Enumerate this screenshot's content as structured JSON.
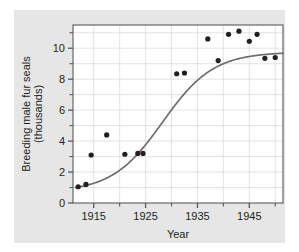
{
  "figure": {
    "partial_caption_top": "",
    "background_color": "#e6e6e6",
    "plot_background_color": "#ffffff",
    "grid_color": "#d7d7d7",
    "axis_color": "#58595b",
    "point_color": "#231f20",
    "curve_color": "#6d6e71"
  },
  "chart_data": {
    "type": "scatter",
    "title": "",
    "xlabel": "Year",
    "ylabel": "Breeding male fur seals (thousands)",
    "ylabel_line1": "Breeding male fur seals",
    "ylabel_line2": "(thousands)",
    "xlim": [
      1911,
      1951.5
    ],
    "ylim": [
      0,
      11.5
    ],
    "xticks": [
      1915,
      1925,
      1935,
      1945
    ],
    "xtick_labels": [
      "1915",
      "1925",
      "1935",
      "1945"
    ],
    "x_minor_ticks": [
      1920,
      1930,
      1940,
      1950
    ],
    "yticks": [
      0,
      2,
      4,
      6,
      8,
      10
    ],
    "ytick_labels": [
      "0",
      "2",
      "4",
      "6",
      "8",
      "10"
    ],
    "y_minor_ticks": [
      1,
      3,
      5,
      7,
      9,
      11
    ],
    "grid": true,
    "legend": "none",
    "series": [
      {
        "name": "Breeding male fur seals",
        "type": "scatter",
        "marker": "filled-circle",
        "points": [
          {
            "x": 1912.0,
            "y": 1.05
          },
          {
            "x": 1913.5,
            "y": 1.2
          },
          {
            "x": 1914.5,
            "y": 3.1
          },
          {
            "x": 1917.5,
            "y": 4.4
          },
          {
            "x": 1921.0,
            "y": 3.15
          },
          {
            "x": 1923.5,
            "y": 3.2
          },
          {
            "x": 1924.5,
            "y": 3.2
          },
          {
            "x": 1931.0,
            "y": 8.35
          },
          {
            "x": 1932.5,
            "y": 8.4
          },
          {
            "x": 1937.0,
            "y": 10.6
          },
          {
            "x": 1939.0,
            "y": 9.2
          },
          {
            "x": 1941.0,
            "y": 10.9
          },
          {
            "x": 1943.0,
            "y": 11.1
          },
          {
            "x": 1945.0,
            "y": 10.45
          },
          {
            "x": 1946.5,
            "y": 10.9
          },
          {
            "x": 1948.0,
            "y": 9.35
          },
          {
            "x": 1950.0,
            "y": 9.4
          }
        ]
      },
      {
        "name": "Fitted logistic curve",
        "type": "line",
        "model": "logistic",
        "asymptote": 9.75,
        "midpoint_year": 1928.3,
        "growth_rate": 0.205,
        "lower_offset": 0.72,
        "x_start": 1911.5,
        "x_end": 1951.5
      }
    ]
  }
}
